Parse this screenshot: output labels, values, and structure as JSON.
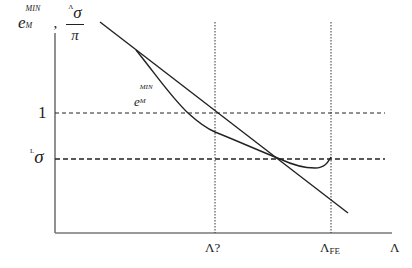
{
  "diagram": {
    "y_axis_label": {
      "base": "e",
      "superscript": "MIN",
      "subscript": "M",
      "separator": ",",
      "fraction_numerator_presup": "Λ",
      "fraction_numerator": "σ",
      "fraction_denominator": "π"
    },
    "x_axis_label": "Λ",
    "y_ticks": [
      {
        "label": "1",
        "y": 113
      },
      {
        "label_presup": "L",
        "label": "σ",
        "y": 159
      }
    ],
    "x_ticks": [
      {
        "label": "Λ?",
        "x": 215
      },
      {
        "label": "Λ",
        "label_sub": "FE",
        "x": 331
      }
    ],
    "curve_label": {
      "base": "e",
      "superscript": "MIN",
      "subscript": "M"
    },
    "colors": {
      "line": "#222222",
      "axis": "#555555",
      "background": "#ffffff"
    }
  }
}
